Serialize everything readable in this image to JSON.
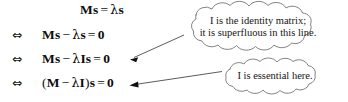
{
  "figure": {
    "background_color": "#ffffff",
    "text_color": "#111111",
    "line_color": "#4a4a4a"
  },
  "equations": [
    {
      "connector": "",
      "lhs_matrix": "M",
      "text": "Ms = λs",
      "parts": {
        "bold_m": "M",
        "bold_s": "s",
        "equals": "=",
        "lambda": "λ",
        "bold_s2": "s"
      }
    },
    {
      "connector": "⇔",
      "text": "Ms − λs = 0",
      "parts": {
        "bold_m": "M",
        "bold_s": "s",
        "minus": "−",
        "lambda": "λ",
        "bold_s2": "s",
        "equals": "=",
        "zero": "0"
      }
    },
    {
      "connector": "⇔",
      "text": "Ms − λIs = 0",
      "parts": {
        "bold_m": "M",
        "bold_s": "s",
        "minus": "−",
        "lambda": "λ",
        "bold_i": "I",
        "bold_s2": "s",
        "equals": "=",
        "zero": "0"
      }
    },
    {
      "connector": "⇔",
      "text": "(M − λI)s = 0",
      "parts": {
        "paren_open": "(",
        "bold_m": "M",
        "minus": "−",
        "lambda": "λ",
        "bold_i": "I",
        "paren_close": ")",
        "bold_s2": "s",
        "equals": "=",
        "zero": "0"
      }
    }
  ],
  "callouts": [
    {
      "id": "cloud-1",
      "lines": [
        "I is the identity matrix;",
        "it is superfluous in this line."
      ],
      "points_to_equation_index": 2
    },
    {
      "id": "cloud-2",
      "lines": [
        "I is essential here."
      ],
      "points_to_equation_index": 3
    }
  ]
}
